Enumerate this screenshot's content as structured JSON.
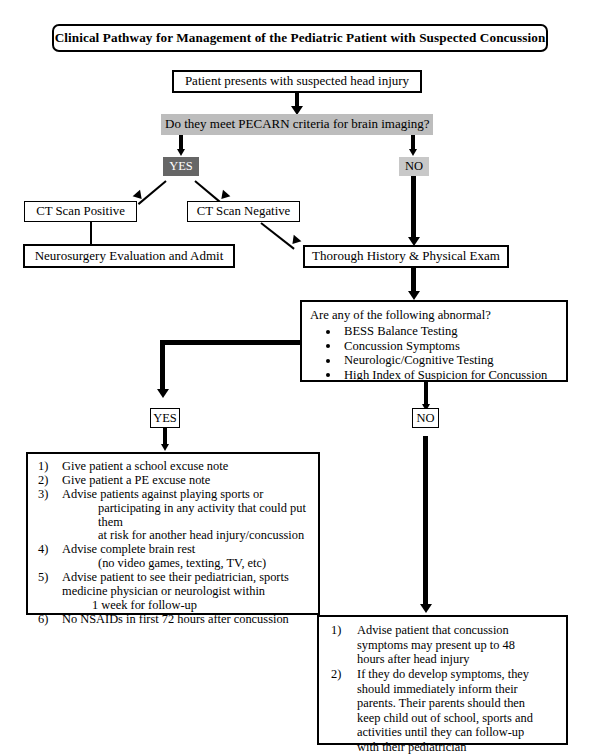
{
  "title": "Clinical Pathway for Management of the Pediatric Patient with Suspected Concussion",
  "nodes": {
    "start": "Patient presents with suspected head injury",
    "decision_pecarn": "Do they meet PECARN criteria for brain imaging?",
    "yes_top": "YES",
    "no_top": "NO",
    "ct_positive": "CT Scan Positive",
    "ct_negative": "CT Scan Negative",
    "neurosurgery": "Neurosurgery Evaluation and Admit",
    "history_exam": "Thorough History & Physical Exam",
    "abnormal_title": "Are any of the following abnormal?",
    "yes_mid": "YES",
    "no_mid": "NO"
  },
  "abnormal_items": [
    "BESS Balance Testing",
    "Concussion Symptoms",
    "Neurologic/Cognitive Testing",
    "High Index of Suspicion for Concussion"
  ],
  "yes_branch_items": [
    {
      "marker": "1)",
      "lines": [
        "Give patient a school excuse note"
      ]
    },
    {
      "marker": "2)",
      "lines": [
        "Give patient a PE excuse note"
      ]
    },
    {
      "marker": "3)",
      "lines": [
        "Advise patients against playing sports or",
        "participating in any activity that could put them",
        "at risk for another head injury/concussion"
      ]
    },
    {
      "marker": "4)",
      "lines": [
        "Advise complete brain rest",
        "(no video games, texting, TV, etc)"
      ]
    },
    {
      "marker": "5)",
      "lines": [
        "Advise patient to see their pediatrician, sports",
        "medicine physician or neurologist within",
        "1 week for follow-up"
      ]
    },
    {
      "marker": "6)",
      "lines": [
        "No NSAIDs in first 72 hours after concussion"
      ]
    }
  ],
  "no_branch_items": [
    {
      "marker": "1)",
      "lines": [
        "Advise patient that concussion",
        "symptoms may present up to 48",
        "hours after head injury"
      ]
    },
    {
      "marker": "2)",
      "lines": [
        "If they do develop symptoms, they",
        "should immediately inform their",
        "parents. Their parents should then",
        "keep child out of school, sports and",
        "activities until they can follow-up",
        "with their pediatrician"
      ]
    }
  ],
  "colors": {
    "decision_fill": "#bdbdbd",
    "yes_fill": "#666666",
    "no_fill": "#c8c8c8",
    "line": "#000000"
  }
}
